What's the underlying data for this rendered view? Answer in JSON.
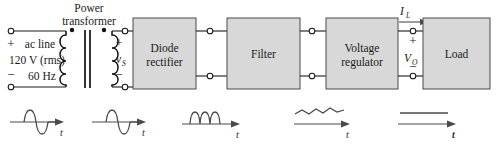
{
  "diagram": {
    "source": {
      "label_line1": "ac line",
      "label_line2": "120 V (rms)",
      "label_line3": "60 Hz",
      "plus": "+",
      "minus": "−"
    },
    "transformer": {
      "label_line1": "Power",
      "label_line2": "transformer",
      "secondary_plus": "+",
      "secondary_minus": "−",
      "secondary_voltage": "v",
      "secondary_voltage_sub": "S"
    },
    "blocks": [
      {
        "id": "diode-rectifier",
        "line1": "Diode",
        "line2": "rectifier"
      },
      {
        "id": "filter",
        "line1": "Filter",
        "line2": ""
      },
      {
        "id": "voltage-regulator",
        "line1": "Voltage",
        "line2": "regulator"
      },
      {
        "id": "load",
        "line1": "Load",
        "line2": ""
      }
    ],
    "output": {
      "current_symbol": "I",
      "current_sub": "L",
      "voltage_symbol": "V",
      "voltage_sub": "O",
      "plus": "+",
      "minus": "−"
    },
    "waveforms": [
      {
        "id": "ac-sine",
        "name": "ac sine wave",
        "axis_label": "t"
      },
      {
        "id": "transformer-sine",
        "name": "stepped-down sine wave",
        "axis_label": "t"
      },
      {
        "id": "rectified",
        "name": "full-wave rectified",
        "axis_label": "t"
      },
      {
        "id": "filtered-ripple",
        "name": "filtered with ripple",
        "axis_label": "t"
      },
      {
        "id": "regulated-dc",
        "name": "regulated dc",
        "axis_label": "t"
      }
    ],
    "colors": {
      "block_fill": "#d8d8d8",
      "block_stroke": "#4a4a4a",
      "wire": "#1a1a1a",
      "wave": "#4a4a4a",
      "background": "#ffffff"
    }
  }
}
